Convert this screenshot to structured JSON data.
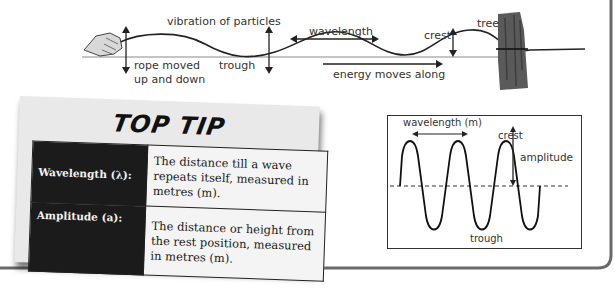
{
  "rope_diagram": {
    "labels": {
      "vibration": "vibration of particles",
      "wavelength": "wavelength",
      "crest": "crest",
      "tree": "tree",
      "rope_moved_line1": "rope moved",
      "rope_moved_line2": "up and down",
      "trough": "trough",
      "energy": "energy moves along"
    }
  },
  "top_tip": {
    "title": "TOP TIP",
    "rows": [
      {
        "term": "Wavelength (λ):",
        "definition": "The distance till a wave repeats itself, measured in metres (m)."
      },
      {
        "term": "Amplitude (a):",
        "definition": "The distance or height from the rest position, measured in metres (m)."
      }
    ]
  },
  "wave_graph": {
    "labels": {
      "wavelength": "wavelength (m)",
      "crest": "crest",
      "amplitude": "amplitude",
      "trough": "trough"
    }
  },
  "colors": {
    "ink": "#222222",
    "card_bg": "#e9e9e9",
    "term_bg": "#1b1b1b",
    "border": "#666666",
    "tree": "#555555"
  }
}
